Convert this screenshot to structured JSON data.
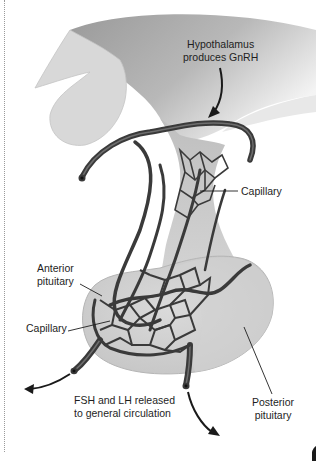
{
  "figure": {
    "labels": {
      "hypothalamus": [
        "Hypothalamus",
        "produces GnRH"
      ],
      "capillary_upper": "Capillary",
      "anterior_pituitary": [
        "Anterior",
        "pituitary"
      ],
      "capillary_lower": "Capillary",
      "release": [
        "FSH and LH released",
        "to general circulation"
      ],
      "posterior_pituitary": [
        "Posterior",
        "pituitary"
      ]
    },
    "colors": {
      "tissue_light": "#d6d6d6",
      "tissue_mid": "#bdbdbd",
      "tissue_dark": "#8c8c8c",
      "vessel": "#3a3a3a",
      "vessel_highlight": "#6e6e6e",
      "text": "#1e1e1e"
    }
  }
}
